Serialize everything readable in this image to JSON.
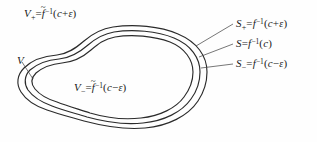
{
  "figure": {
    "kind": "level-set-diagram",
    "background_color": "#fefefe",
    "stroke_color": "#2b2b2b",
    "leader_color": "#4a4a4a",
    "width": 317,
    "height": 142
  },
  "labels": {
    "v_plus": {
      "lhs": "V",
      "lhs_sub": "+",
      "equals": "=",
      "fn": "f",
      "fn_accent": "~",
      "fn_exponent": "−1",
      "open": "(",
      "arg_main": "c",
      "arg_op": "+",
      "arg_eps": "ε",
      "close": ")"
    },
    "v": {
      "lhs": "V"
    },
    "v_minus": {
      "lhs": "V",
      "lhs_sub": "−",
      "equals": "=",
      "fn": "f",
      "fn_accent": "~",
      "fn_exponent": "−1",
      "open": "(",
      "arg_main": "c",
      "arg_op": "−",
      "arg_eps": "ε",
      "close": ")"
    },
    "s_plus": {
      "lhs": "S",
      "lhs_sub": "+",
      "equals": "=",
      "fn": "f",
      "fn_exponent": "−1",
      "open": "(",
      "arg_main": "c",
      "arg_op": "+",
      "arg_eps": "ε",
      "close": ")"
    },
    "s": {
      "lhs": "S",
      "equals": "=",
      "fn": "f",
      "fn_exponent": "−1",
      "open": "(",
      "arg_main": "c",
      "close": ")"
    },
    "s_minus": {
      "lhs": "S",
      "lhs_sub": "−",
      "equals": "=",
      "fn": "f",
      "fn_exponent": "−1",
      "open": "(",
      "arg_main": "c",
      "arg_op": "−",
      "arg_eps": "ε",
      "close": ")"
    }
  },
  "curves": {
    "outer": "M 207 72 C 207 56 197 42 178 34 C 160 26 134 24 113 27 C 100 29 92 34 84 41 C 76 48 68 54 57 55 C 44 56 32 60 24 68 C 17 75 16 84 21 92 C 26 100 35 106 47 110 C 58 114 70 117 84 121 C 103 126 124 130 145 128 C 168 126 188 116 198 101 C 204 92 207 82 207 72 Z",
    "middle": "M 200 72 C 200 58 191 45 174 38 C 157 31 133 29 114 32 C 102 34 95 39 88 45 C 80 52 71 58 59 59 C 47 60 37 64 30 70 C 24 76 24 84 28 90 C 33 97 41 102 52 106 C 62 110 74 113 87 117 C 105 122 124 125 143 123 C 164 121 182 112 191 99 C 197 91 200 81 200 72 Z",
    "inner": "M 193 72 C 193 60 185 48 170 42 C 154 36 132 34 115 37 C 104 39 98 44 91 50 C 83 57 74 62 62 63 C 51 64 42 68 36 73 C 31 78 31 84 35 89 C 40 95 47 99 57 102 C 67 106 78 109 90 113 C 107 118 124 120 141 118 C 160 116 176 108 184 97 C 190 89 193 80 193 72 Z",
    "leaders": [
      "M 233 24 L 196 46",
      "M 233 44 L 199 57",
      "M 233 64 L 201 68",
      "M 22 62 L 33 79"
    ]
  }
}
